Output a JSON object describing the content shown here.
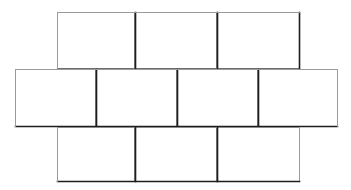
{
  "figure": {
    "background_color": "#ffffff",
    "stroke_color": "#3b3b3b",
    "stroke_color_dark": "#2a2a2a",
    "stroke_color_light": "#8a8a8a",
    "fill_color": "#ffffff",
    "canvas": {
      "width": 351,
      "height": 190
    },
    "tile": {
      "width": 81,
      "height": 57
    },
    "rows": [
      {
        "name": "top-row",
        "y": 12,
        "height": 57,
        "x_start": 57,
        "count": 3,
        "tiles": [
          {
            "label": "top-1",
            "x": 57,
            "y": 12,
            "w": 78,
            "h": 57
          },
          {
            "label": "top-2",
            "x": 135,
            "y": 12,
            "w": 82,
            "h": 57
          },
          {
            "label": "top-3",
            "x": 217,
            "y": 12,
            "w": 83,
            "h": 57
          }
        ]
      },
      {
        "name": "middle-row",
        "y": 69,
        "height": 58,
        "x_start": 15,
        "count": 4,
        "tiles": [
          {
            "label": "mid-1",
            "x": 15,
            "y": 69,
            "w": 81,
            "h": 58
          },
          {
            "label": "mid-2",
            "x": 96,
            "y": 69,
            "w": 81,
            "h": 58
          },
          {
            "label": "mid-3",
            "x": 177,
            "y": 69,
            "w": 81,
            "h": 58
          },
          {
            "label": "mid-4",
            "x": 258,
            "y": 69,
            "w": 80,
            "h": 58
          }
        ]
      },
      {
        "name": "bottom-row",
        "y": 127,
        "height": 55,
        "x_start": 57,
        "count": 3,
        "tiles": [
          {
            "label": "bot-1",
            "x": 57,
            "y": 127,
            "w": 78,
            "h": 55
          },
          {
            "label": "bot-2",
            "x": 135,
            "y": 127,
            "w": 82,
            "h": 55
          },
          {
            "label": "bot-3",
            "x": 217,
            "y": 127,
            "w": 83,
            "h": 55
          }
        ]
      }
    ],
    "totals": {
      "tile_count": 10,
      "row_count": 3
    }
  }
}
